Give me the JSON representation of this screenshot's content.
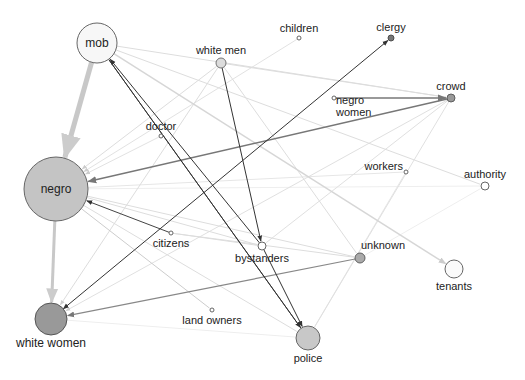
{
  "diagram": {
    "type": "directed network graph",
    "nodes": [
      {
        "id": "mob",
        "label": "mob",
        "x": 97,
        "y": 43,
        "r": 20,
        "fill": "#f7f7f7",
        "stroke": "#666",
        "label_pos": "center"
      },
      {
        "id": "white_men",
        "label": "white men",
        "x": 221,
        "y": 63,
        "r": 5,
        "fill": "#dcdcdc",
        "stroke": "#666",
        "label_pos": "above"
      },
      {
        "id": "children",
        "label": "children",
        "x": 299,
        "y": 38,
        "r": 2,
        "fill": "#fff",
        "stroke": "#555",
        "label_pos": "above"
      },
      {
        "id": "clergy",
        "label": "clergy",
        "x": 391,
        "y": 38,
        "r": 3,
        "fill": "#777",
        "stroke": "#444",
        "label_pos": "above"
      },
      {
        "id": "crowd",
        "label": "crowd",
        "x": 451,
        "y": 98,
        "r": 4,
        "fill": "#999",
        "stroke": "#555",
        "label_pos": "above"
      },
      {
        "id": "negro_women",
        "label": "negro women",
        "lines": [
          "negro",
          "women"
        ],
        "x": 334,
        "y": 98,
        "r": 2,
        "fill": "#fff",
        "stroke": "#555",
        "label_pos": "right-below"
      },
      {
        "id": "doctor",
        "label": "doctor",
        "x": 161,
        "y": 136,
        "r": 2,
        "fill": "#fff",
        "stroke": "#555",
        "label_pos": "above"
      },
      {
        "id": "negro",
        "label": "negro",
        "x": 56,
        "y": 189,
        "r": 32,
        "fill": "#c4c4c4",
        "stroke": "#666",
        "label_pos": "center"
      },
      {
        "id": "workers",
        "label": "workers",
        "x": 406,
        "y": 172,
        "r": 2,
        "fill": "#fff",
        "stroke": "#555",
        "label_pos": "left-above"
      },
      {
        "id": "authority",
        "label": "authority",
        "x": 485,
        "y": 186,
        "r": 4,
        "fill": "#fff",
        "stroke": "#555",
        "label_pos": "above"
      },
      {
        "id": "citizens",
        "label": "citizens",
        "x": 171,
        "y": 233,
        "r": 2,
        "fill": "#fff",
        "stroke": "#555",
        "label_pos": "below"
      },
      {
        "id": "bystanders",
        "label": "bystanders",
        "x": 262,
        "y": 246,
        "r": 4,
        "fill": "#fff",
        "stroke": "#555",
        "label_pos": "below"
      },
      {
        "id": "unknown",
        "label": "unknown",
        "x": 360,
        "y": 258,
        "r": 5,
        "fill": "#aaa",
        "stroke": "#555",
        "label_pos": "above-right"
      },
      {
        "id": "tenants",
        "label": "tenants",
        "x": 454,
        "y": 269,
        "r": 9,
        "fill": "#fafafa",
        "stroke": "#666",
        "label_pos": "below"
      },
      {
        "id": "white_women",
        "label": "white women",
        "x": 51,
        "y": 319,
        "r": 16,
        "fill": "#999",
        "stroke": "#555",
        "label_pos": "below"
      },
      {
        "id": "land_owners",
        "label": "land owners",
        "x": 212,
        "y": 310,
        "r": 2,
        "fill": "#fff",
        "stroke": "#555",
        "label_pos": "below"
      },
      {
        "id": "police",
        "label": "police",
        "x": 308,
        "y": 338,
        "r": 12,
        "fill": "#c8c8c8",
        "stroke": "#666",
        "label_pos": "below"
      }
    ],
    "edges": [
      {
        "from": "mob",
        "to": "negro",
        "color": "#c8c8c8",
        "width": 5,
        "arrow": true
      },
      {
        "from": "negro",
        "to": "white_women",
        "color": "#c8c8c8",
        "width": 3,
        "arrow": true
      },
      {
        "from": "bystanders",
        "to": "mob",
        "color": "#333",
        "width": 1,
        "arrow": true
      },
      {
        "from": "police",
        "to": "mob",
        "color": "#444",
        "width": 1,
        "arrow": false
      },
      {
        "from": "white_men",
        "to": "bystanders",
        "color": "#333",
        "width": 1,
        "arrow": true
      },
      {
        "from": "mob",
        "to": "police",
        "color": "#333",
        "width": 1,
        "arrow": true
      },
      {
        "from": "bystanders",
        "to": "police",
        "color": "#333",
        "width": 1,
        "arrow": true
      },
      {
        "from": "white_women",
        "to": "clergy",
        "color": "#333",
        "width": 1,
        "arrow": true,
        "reverse_arrow": true
      },
      {
        "from": "citizens",
        "to": "negro",
        "color": "#444",
        "width": 1,
        "arrow": true
      },
      {
        "from": "crowd",
        "to": "negro",
        "color": "#777",
        "width": 1.5,
        "arrow": true
      },
      {
        "from": "negro_women",
        "to": "crowd",
        "color": "#777",
        "width": 1.5,
        "arrow": true
      },
      {
        "from": "unknown",
        "to": "white_women",
        "color": "#888",
        "width": 1.2,
        "arrow": true
      },
      {
        "from": "mob",
        "to": "crowd",
        "color": "#ddd",
        "width": 1,
        "arrow": false
      },
      {
        "from": "mob",
        "to": "authority",
        "color": "#ddd",
        "width": 1,
        "arrow": false
      },
      {
        "from": "mob",
        "to": "tenants",
        "color": "#d6d6d6",
        "width": 1.5,
        "arrow": true
      },
      {
        "from": "white_men",
        "to": "negro",
        "color": "#ddd",
        "width": 1,
        "arrow": true
      },
      {
        "from": "white_men",
        "to": "white_women",
        "color": "#ddd",
        "width": 1,
        "arrow": true
      },
      {
        "from": "white_men",
        "to": "crowd",
        "color": "#ddd",
        "width": 1,
        "arrow": false
      },
      {
        "from": "white_men",
        "to": "unknown",
        "color": "#ddd",
        "width": 1,
        "arrow": false
      },
      {
        "from": "children",
        "to": "negro",
        "color": "#e2e2e2",
        "width": 1,
        "arrow": true
      },
      {
        "from": "crowd",
        "to": "white_women",
        "color": "#e0e0e0",
        "width": 1,
        "arrow": true
      },
      {
        "from": "crowd",
        "to": "bystanders",
        "color": "#e0e0e0",
        "width": 1,
        "arrow": false
      },
      {
        "from": "crowd",
        "to": "police",
        "color": "#e0e0e0",
        "width": 1,
        "arrow": false
      },
      {
        "from": "doctor",
        "to": "negro",
        "color": "#e2e2e2",
        "width": 1,
        "arrow": true
      },
      {
        "from": "negro",
        "to": "bystanders",
        "color": "#ddd",
        "width": 1,
        "arrow": false
      },
      {
        "from": "negro",
        "to": "unknown",
        "color": "#ddd",
        "width": 1,
        "arrow": false
      },
      {
        "from": "negro",
        "to": "police",
        "color": "#ddd",
        "width": 1,
        "arrow": false
      },
      {
        "from": "negro",
        "to": "land_owners",
        "color": "#ccc",
        "width": 1,
        "arrow": false
      },
      {
        "from": "negro",
        "to": "workers",
        "color": "#e6e6e6",
        "width": 1,
        "arrow": false
      },
      {
        "from": "citizens",
        "to": "bystanders",
        "color": "#ddd",
        "width": 1,
        "arrow": false
      },
      {
        "from": "citizens",
        "to": "unknown",
        "color": "#ddd",
        "width": 1,
        "arrow": false
      },
      {
        "from": "white_women",
        "to": "police",
        "color": "#eee",
        "width": 1,
        "arrow": false
      },
      {
        "from": "unknown",
        "to": "authority",
        "color": "#eee",
        "width": 1,
        "arrow": false
      },
      {
        "from": "workers",
        "to": "police",
        "color": "#e6e6e6",
        "width": 1,
        "arrow": false
      },
      {
        "from": "negro",
        "to": "authority",
        "color": "#eee",
        "width": 1,
        "arrow": false
      }
    ]
  }
}
